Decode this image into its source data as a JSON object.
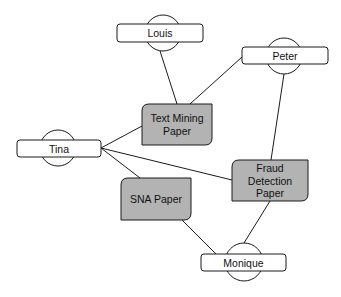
{
  "diagram": {
    "type": "bipartite-network",
    "colors": {
      "background": "#ffffff",
      "stroke": "#1a1a1a",
      "person_fill": "#ffffff",
      "paper_fill": "#b3b3b3"
    },
    "people": [
      {
        "id": "louis",
        "label": "Louis",
        "cx": 163,
        "cy": 33,
        "r": 18,
        "rect": [
          117,
          24,
          86,
          18
        ]
      },
      {
        "id": "peter",
        "label": "Peter",
        "cx": 284,
        "cy": 56,
        "r": 18,
        "rect": [
          242,
          47,
          86,
          17
        ]
      },
      {
        "id": "tina",
        "label": "Tina",
        "cx": 58,
        "cy": 148,
        "r": 18,
        "rect": [
          17,
          140,
          84,
          17
        ]
      },
      {
        "id": "monique",
        "label": "Monique",
        "cx": 244,
        "cy": 262,
        "r": 19,
        "rect": [
          201,
          254,
          85,
          17
        ]
      }
    ],
    "papers": [
      {
        "id": "text-mining",
        "label_lines": [
          "Text Mining",
          "Paper"
        ],
        "rect": [
          142,
          104,
          70,
          41
        ]
      },
      {
        "id": "sna",
        "label_lines": [
          "SNA Paper"
        ],
        "rect": [
          121,
          178,
          70,
          42
        ]
      },
      {
        "id": "fraud-detection",
        "label_lines": [
          "Fraud",
          "Detection",
          "Paper"
        ],
        "rect": [
          232,
          160,
          76,
          41
        ]
      }
    ],
    "edges": [
      {
        "from": "louis",
        "to": "text-mining",
        "line": [
          160,
          51,
          177,
          104
        ]
      },
      {
        "from": "peter",
        "to": "text-mining",
        "line": [
          242,
          57,
          190,
          104
        ]
      },
      {
        "from": "peter",
        "to": "fraud-detection",
        "line": [
          284,
          74,
          271,
          160
        ]
      },
      {
        "from": "tina",
        "to": "text-mining",
        "line": [
          101,
          148,
          142,
          126
        ]
      },
      {
        "from": "tina",
        "to": "sna",
        "line": [
          101,
          148,
          140,
          178
        ]
      },
      {
        "from": "tina",
        "to": "fraud-detection",
        "line": [
          101,
          148,
          232,
          180
        ]
      },
      {
        "from": "sna",
        "to": "monique",
        "line": [
          182,
          220,
          216,
          254
        ]
      },
      {
        "from": "fraud-detection",
        "to": "monique",
        "line": [
          270,
          201,
          244,
          243
        ]
      }
    ]
  }
}
